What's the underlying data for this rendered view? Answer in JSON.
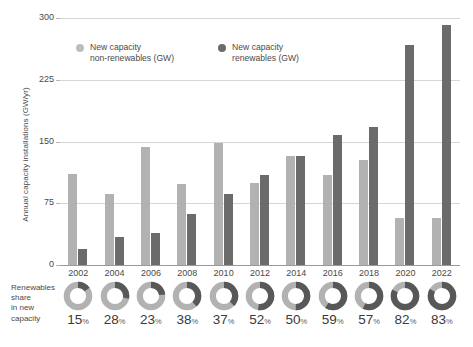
{
  "chart_data": {
    "type": "bar",
    "title": "",
    "xlabel": "",
    "ylabel": "Annual capacity installations (GW/yr)",
    "ylim": [
      0,
      300
    ],
    "yticks": [
      0,
      75,
      150,
      225,
      300
    ],
    "ytick_labels": [
      "0",
      "75",
      "150",
      "225",
      "300"
    ],
    "grid": true,
    "legend_position": "top-center",
    "categories": [
      "2002",
      "2004",
      "2006",
      "2008",
      "2010",
      "2012",
      "2014",
      "2016",
      "2018",
      "2020",
      "2022"
    ],
    "series": [
      {
        "name": "New capacity\nnon-renewables (GW)",
        "color": "#b2b2b2",
        "values": [
          110,
          86,
          143,
          99,
          148,
          100,
          132,
          109,
          127,
          57,
          57
        ]
      },
      {
        "name": "New capacity\nrenewables (GW)",
        "color": "#6b6b6b",
        "values": [
          19,
          34,
          39,
          62,
          86,
          109,
          132,
          158,
          168,
          267,
          292
        ]
      }
    ],
    "annotation_row": {
      "label": "Renewables\nshare\nin new\ncapacity",
      "unit": "%",
      "type": "donut",
      "ring_color": "#b2b2b2",
      "arc_color": "#585858",
      "values": [
        15,
        28,
        23,
        38,
        37,
        52,
        50,
        59,
        57,
        82,
        83
      ],
      "value_labels": [
        "15",
        "28",
        "23",
        "38",
        "37",
        "52",
        "50",
        "59",
        "57",
        "82",
        "83"
      ]
    }
  },
  "legend": {
    "items": [
      {
        "label": "New capacity\nnon-renewables (GW)",
        "color": "#bdbdbd"
      },
      {
        "label": "New capacity\nrenewables (GW)",
        "color": "#6b6b6b"
      }
    ]
  }
}
